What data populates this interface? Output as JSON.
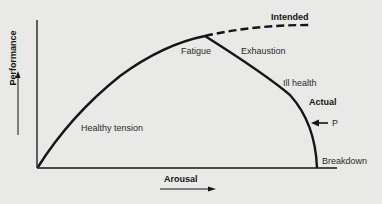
{
  "diagram": {
    "type": "yerkes-dodson-performance-curve",
    "axes": {
      "x_label": "Arousal",
      "y_label": "Performance"
    },
    "curves": {
      "intended": "Intended",
      "actual": "Actual"
    },
    "annotations": {
      "healthy_tension": "Healthy tension",
      "fatigue": "Fatigue",
      "exhaustion": "Exhaustion",
      "ill_health": "Ill health",
      "p_marker": "P",
      "breakdown": "Breakdown"
    },
    "colors": {
      "background": "#e9e9e7",
      "line": "#151515",
      "text": "#2a2a2a"
    }
  }
}
